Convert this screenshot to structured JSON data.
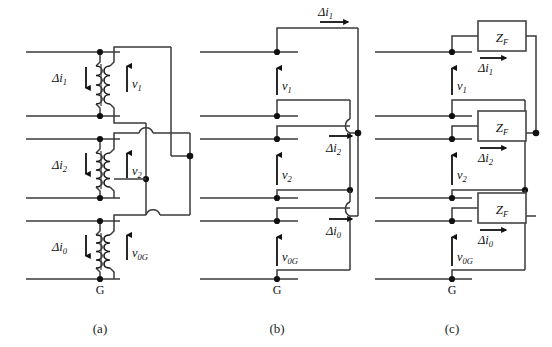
{
  "figure": {
    "background_color": "#ffffff",
    "wire_color": "#3a3a3a",
    "node_color": "#111111",
    "text_color": "#111111"
  },
  "panels": [
    {
      "id": "a",
      "caption": "(a)",
      "kind": "coupled-transformer-network",
      "ground_label": "G",
      "current_labels": [
        {
          "base": "Δi",
          "sub": "1",
          "text": "Δi₁",
          "direction": "down"
        },
        {
          "base": "Δi",
          "sub": "2",
          "text": "Δi₂",
          "direction": "down"
        },
        {
          "base": "Δi",
          "sub": "0",
          "text": "Δi₀",
          "direction": "down"
        }
      ],
      "voltage_labels": [
        {
          "base": "v",
          "sub": "1",
          "text": "v₁",
          "direction": "up"
        },
        {
          "base": "v",
          "sub": "2",
          "text": "v₂",
          "direction": "up"
        },
        {
          "base": "v",
          "sub": "0G",
          "text": "v₀G",
          "direction": "up"
        }
      ]
    },
    {
      "id": "b",
      "caption": "(b)",
      "kind": "source-network",
      "ground_label": "G",
      "current_labels": [
        {
          "base": "Δi",
          "sub": "1",
          "text": "Δi₁",
          "direction": "right"
        },
        {
          "base": "Δi",
          "sub": "2",
          "text": "Δi₂",
          "direction": "right"
        },
        {
          "base": "Δi",
          "sub": "0",
          "text": "Δi₀",
          "direction": "right"
        }
      ],
      "voltage_labels": [
        {
          "base": "v",
          "sub": "1",
          "text": "v₁",
          "direction": "up"
        },
        {
          "base": "v",
          "sub": "2",
          "text": "v₂",
          "direction": "up"
        },
        {
          "base": "v",
          "sub": "0G",
          "text": "v₀G",
          "direction": "up"
        }
      ]
    },
    {
      "id": "c",
      "caption": "(c)",
      "kind": "fault-impedance-network",
      "ground_label": "G",
      "impedance_label": "Z",
      "impedance_sub": "F",
      "impedance_text": "Z_F",
      "impedance_boxes": [
        {
          "label": "Z",
          "sub": "F"
        },
        {
          "label": "Z",
          "sub": "F"
        },
        {
          "label": "Z",
          "sub": "F"
        }
      ],
      "current_labels": [
        {
          "base": "Δi",
          "sub": "1",
          "text": "Δi₁",
          "direction": "right"
        },
        {
          "base": "Δi",
          "sub": "2",
          "text": "Δi₂",
          "direction": "right"
        },
        {
          "base": "Δi",
          "sub": "0",
          "text": "Δi₀",
          "direction": "right"
        }
      ],
      "voltage_labels": [
        {
          "base": "v",
          "sub": "1",
          "text": "v₁",
          "direction": "up"
        },
        {
          "base": "v",
          "sub": "2",
          "text": "v₂",
          "direction": "up"
        },
        {
          "base": "v",
          "sub": "0G",
          "text": "v₀G",
          "direction": "up"
        }
      ]
    }
  ],
  "captions": {
    "a": "(a)",
    "b": "(b)",
    "c": "(c)"
  },
  "symbols": {
    "delta": "Δ",
    "ground": "G",
    "impedance": "Z",
    "impedance_subscript": "F",
    "voltage": "v",
    "current": "i"
  }
}
